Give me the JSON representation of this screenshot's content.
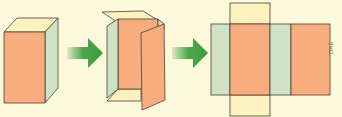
{
  "diagram": {
    "stages": [
      {
        "id": "closed-cuboid",
        "label": "Closed cuboid"
      },
      {
        "id": "opening-cuboid",
        "label": "Cuboid being opened"
      },
      {
        "id": "cuboid-net",
        "label": "Flat net of cuboid"
      }
    ],
    "arrows": 2,
    "credit": "DAE",
    "colors": {
      "background": "#fbf8dc",
      "front_face": "#f7ad7d",
      "side_face": "#cfe3c4",
      "top_face": "#fcf1bf",
      "outline": "#4a3f35",
      "arrow": "#3e9a3e"
    }
  }
}
